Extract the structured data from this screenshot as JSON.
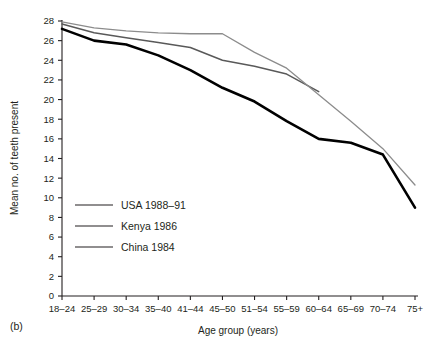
{
  "figure": {
    "panel_label": "(b)",
    "xlabel": "Age group (years)",
    "ylabel": "Mean no. of teeth present"
  },
  "legend": {
    "items": [
      {
        "label": "USA 1988–91",
        "color": "#000000",
        "width": 2.6
      },
      {
        "label": "Kenya 1986",
        "color": "#595959",
        "width": 1.5
      },
      {
        "label": "China 1984",
        "color": "#8c8c8c",
        "width": 1.3
      }
    ]
  },
  "axes": {
    "y_ticks": [
      "0",
      "2",
      "4",
      "6",
      "8",
      "10",
      "12",
      "14",
      "16",
      "18",
      "20",
      "22",
      "24",
      "26",
      "28"
    ],
    "x_ticks": [
      "18–24",
      "25–29",
      "30–34",
      "35–40",
      "41–44",
      "45–50",
      "51–54",
      "55–59",
      "60–64",
      "65–69",
      "70–74",
      "75+"
    ]
  },
  "chart_data": {
    "type": "line",
    "title": "",
    "xlabel": "Age group (years)",
    "ylabel": "Mean no. of teeth present",
    "ylim": [
      0,
      28
    ],
    "ytick_step": 2,
    "grid": false,
    "legend_position": "inside-lower-left",
    "categories": [
      "18–24",
      "25–29",
      "30–34",
      "35–40",
      "41–44",
      "45–50",
      "51–54",
      "55–59",
      "60–64",
      "65–69",
      "70–74",
      "75+"
    ],
    "series": [
      {
        "name": "USA 1988–91",
        "color": "#000000",
        "values": [
          27.2,
          26.0,
          25.6,
          24.5,
          23.0,
          21.2,
          19.8,
          17.8,
          16.0,
          15.6,
          14.4,
          9.0
        ]
      },
      {
        "name": "Kenya 1986",
        "color": "#595959",
        "values": [
          27.7,
          26.8,
          26.3,
          25.8,
          25.3,
          24.0,
          23.4,
          22.6,
          20.8,
          null,
          null,
          null
        ]
      },
      {
        "name": "China 1984",
        "color": "#8c8c8c",
        "values": [
          27.9,
          27.3,
          27.0,
          26.8,
          26.7,
          26.7,
          24.8,
          23.2,
          20.5,
          17.8,
          15.0,
          11.3
        ]
      }
    ]
  }
}
